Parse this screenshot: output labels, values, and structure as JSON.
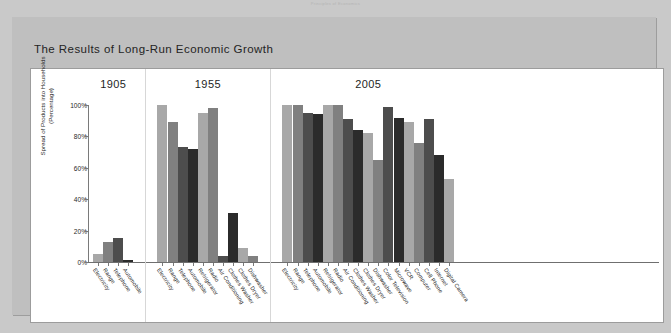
{
  "page": {
    "running_head": "Principles of Economics"
  },
  "figure": {
    "title": "The Results of Long-Run Economic Growth"
  },
  "chart_data": {
    "type": "bar",
    "title": "The Results of Long-Run Economic Growth",
    "xlabel": "",
    "ylabel": "Spread of Products into Households (Percentage)",
    "ylim": [
      0,
      100
    ],
    "ytick_labels": [
      "0%",
      "20%",
      "40%",
      "60%",
      "80%",
      "100%"
    ],
    "ytick_values": [
      0,
      20,
      40,
      60,
      80,
      100
    ],
    "grid": false,
    "legend": "none",
    "groups": [
      {
        "label": "1905",
        "categories": [
          "Electricity",
          "Range",
          "Telephone",
          "Automobile"
        ],
        "values": [
          5,
          13,
          15,
          1
        ]
      },
      {
        "label": "1955",
        "categories": [
          "Electricity",
          "Range",
          "Telephone",
          "Automobile",
          "Refrigerator",
          "Radio",
          "Air Conditioning",
          "Clothes Washer",
          "Clothes Dryer",
          "Dishwasher"
        ],
        "values": [
          100,
          89,
          73,
          72,
          95,
          98,
          4,
          31,
          9,
          4
        ]
      },
      {
        "label": "2005",
        "categories": [
          "Electricity",
          "Range",
          "Telephone",
          "Automobile",
          "Refrigerator",
          "Radio",
          "Air Conditioning",
          "Clothes Washer",
          "Clothes Dryer",
          "Dishwasher",
          "Color Television",
          "Microwave",
          "VCR",
          "Computer",
          "Cell Phone",
          "Internet",
          "Digital Camera"
        ],
        "values": [
          100,
          100,
          95,
          94,
          100,
          100,
          91,
          84,
          82,
          65,
          99,
          92,
          89,
          76,
          91,
          68,
          53
        ]
      }
    ],
    "bar_colors": [
      "#a8a8a8",
      "#808080",
      "#4d4d4d",
      "#2b2b2b"
    ]
  }
}
